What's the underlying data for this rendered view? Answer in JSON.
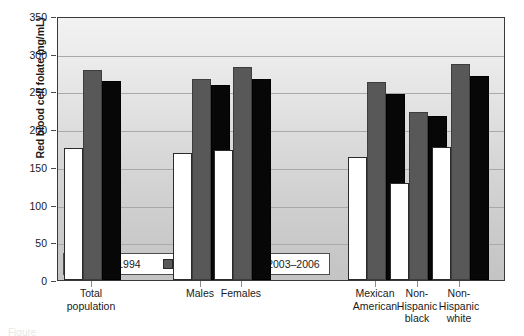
{
  "chart_data": {
    "type": "bar",
    "title": "",
    "xlabel": "",
    "ylabel": "Red blood cell folate (ng/mL)",
    "ylim": [
      0,
      350
    ],
    "yticks": [
      0,
      50,
      100,
      150,
      200,
      250,
      300,
      350
    ],
    "grid": true,
    "legend_position": "inside-bottom-left",
    "categories": [
      "Total\npopulation",
      "Males",
      "Females",
      "Mexican\nAmerican",
      "Non-\nHispanic\nblack",
      "Non-\nHispanic\nwhite"
    ],
    "series": [
      {
        "name": "1988–1994",
        "color": "#ffffff",
        "values": [
          175,
          168,
          172,
          163,
          128,
          176
        ]
      },
      {
        "name": "1999–2002",
        "color": "#585858",
        "values": [
          279,
          267,
          283,
          262,
          223,
          286
        ]
      },
      {
        "name": "2003–2006",
        "color": "#070707",
        "values": [
          264,
          258,
          266,
          247,
          217,
          270
        ]
      }
    ]
  },
  "legend": {
    "entries": [
      {
        "label": "1988–1994"
      },
      {
        "label": "1999–2002"
      },
      {
        "label": "2003–2006"
      }
    ]
  },
  "caption": {
    "sliver_text": "Figure"
  }
}
